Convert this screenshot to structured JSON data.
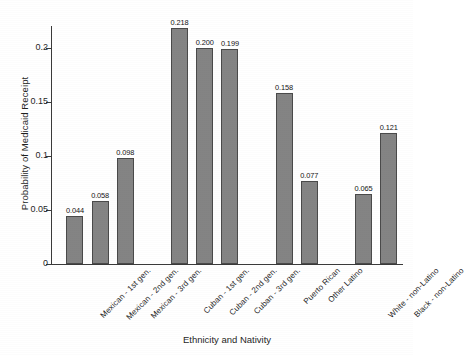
{
  "chart_data": {
    "type": "bar",
    "title": "",
    "xlabel": "Ethnicity and Nativity",
    "ylabel": "Probability of Medicaid Receipt",
    "categories": [
      "Mexican - 1st gen.",
      "Mexican - 2nd gen.",
      "Mexican - 3rd gen.",
      "Cuban - 1st gen.",
      "Cuban - 2nd gen.",
      "Cuban - 3rd gen.",
      "Puerto Rican",
      "Other Latino",
      "White - non-Latino",
      "Black - non-Latino"
    ],
    "values": [
      0.044,
      0.058,
      0.098,
      0.218,
      0.2,
      0.199,
      0.158,
      0.077,
      0.065,
      0.121
    ],
    "value_labels": [
      "0.044",
      "0.058",
      "0.098",
      "0.218",
      "0.200",
      "0.199",
      "0.158",
      "0.077",
      "0.065",
      "0.121"
    ],
    "groups": [
      {
        "name": "Mexican",
        "indices": [
          0,
          1,
          2
        ]
      },
      {
        "name": "Cuban",
        "indices": [
          3,
          4,
          5
        ]
      },
      {
        "name": "Puerto Rican / Other Latino",
        "indices": [
          6,
          7
        ]
      },
      {
        "name": "Non-Latino",
        "indices": [
          8,
          9
        ]
      }
    ],
    "ylim": [
      0,
      0.2255
    ],
    "yticks": [
      0,
      0.05,
      0.1,
      0.15,
      0.2
    ],
    "ytick_labels": [
      "0",
      "0.05",
      "0.1",
      "0.15",
      "0.2"
    ],
    "grid": false,
    "legend": "none",
    "bar_color": "#848484",
    "bar_edge_color": "#4a4a4a",
    "axis_color": "#3a3a3a"
  }
}
